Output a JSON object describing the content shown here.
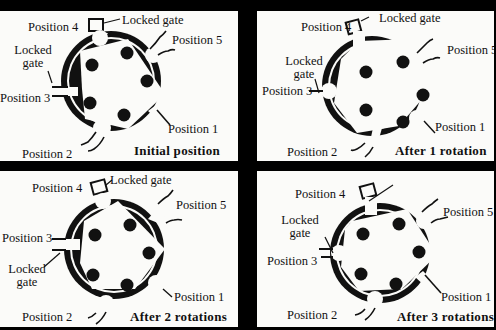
{
  "figure": {
    "title": "",
    "panels": [
      {
        "id": "initial",
        "caption": "Initial position",
        "labels": {
          "pos1": "Position 1",
          "pos2": "Position 2",
          "pos3": "Position 3",
          "pos4": "Position 4",
          "pos5": "Position 5",
          "locked_gate_top": "Locked gate",
          "locked_gate_side_l1": "Locked",
          "locked_gate_side_l2": "gate"
        }
      },
      {
        "id": "rotation-1",
        "caption": "After 1 rotation",
        "labels": {
          "pos1": "Position 1",
          "pos2": "Position 2",
          "pos3": "Position 3",
          "pos4": "Position 4",
          "pos5": "Position 5",
          "locked_gate_top": "Locked gate",
          "locked_gate_side_l1": "Locked",
          "locked_gate_side_l2": "gate"
        }
      },
      {
        "id": "rotation-2",
        "caption": "After 2 rotations",
        "labels": {
          "pos1": "Position 1",
          "pos2": "Position 2",
          "pos3": "Position 3",
          "pos4": "Position 4",
          "pos5": "Position 5",
          "locked_gate_top": "Locked gate",
          "locked_gate_side_l1": "Locked",
          "locked_gate_side_l2": "gate"
        }
      },
      {
        "id": "rotation-3",
        "caption": "After 3 rotations",
        "labels": {
          "pos1": "Position 1",
          "pos2": "Position 2",
          "pos3": "Position 3",
          "pos4": "Position 4",
          "pos5": "Position 5",
          "locked_gate_side_l1": "Locked",
          "locked_gate_side_l2": "gate"
        }
      }
    ]
  },
  "colors": {
    "background": "#000000",
    "panel": "#fbfbf9",
    "ink": "#111111"
  }
}
